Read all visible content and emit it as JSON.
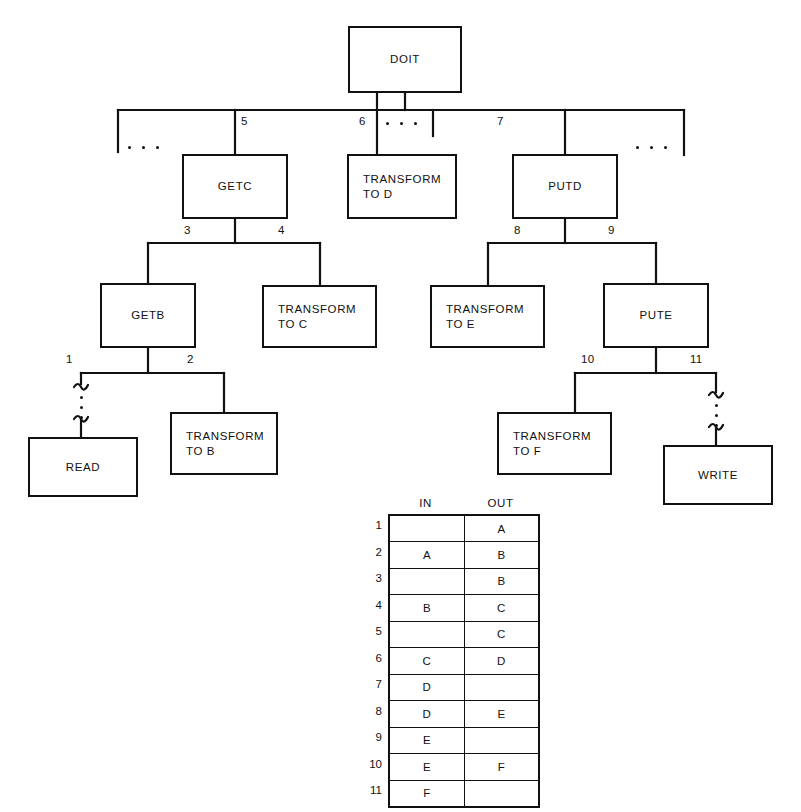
{
  "diagram": {
    "nodes": [
      {
        "id": "doit",
        "label": "DOIT",
        "x": 348,
        "y": 26,
        "w": 114,
        "h": 67,
        "align": "center"
      },
      {
        "id": "getc",
        "label": "GETC",
        "x": 182,
        "y": 154,
        "w": 106,
        "h": 65,
        "align": "center"
      },
      {
        "id": "transform_d",
        "label": "TRANSFORM\nTO D",
        "x": 347,
        "y": 154,
        "w": 110,
        "h": 65,
        "align": "left"
      },
      {
        "id": "putd",
        "label": "PUTD",
        "x": 512,
        "y": 154,
        "w": 106,
        "h": 65,
        "align": "center"
      },
      {
        "id": "getb",
        "label": "GETB",
        "x": 100,
        "y": 283,
        "w": 96,
        "h": 65,
        "align": "center"
      },
      {
        "id": "transform_c",
        "label": "TRANSFORM\nTO C",
        "x": 262,
        "y": 285,
        "w": 115,
        "h": 63,
        "align": "left"
      },
      {
        "id": "transform_e",
        "label": "TRANSFORM\nTO E",
        "x": 430,
        "y": 285,
        "w": 115,
        "h": 63,
        "align": "left"
      },
      {
        "id": "pute",
        "label": "PUTE",
        "x": 603,
        "y": 283,
        "w": 106,
        "h": 65,
        "align": "center"
      },
      {
        "id": "read",
        "label": "READ",
        "x": 28,
        "y": 437,
        "w": 110,
        "h": 60,
        "align": "center"
      },
      {
        "id": "transform_b",
        "label": "TRANSFORM\nTO B",
        "x": 170,
        "y": 412,
        "w": 108,
        "h": 63,
        "align": "left"
      },
      {
        "id": "transform_f",
        "label": "TRANSFORM\nTO F",
        "x": 497,
        "y": 412,
        "w": 115,
        "h": 63,
        "align": "left"
      },
      {
        "id": "write",
        "label": "WRITE",
        "x": 663,
        "y": 445,
        "w": 110,
        "h": 60,
        "align": "center"
      }
    ],
    "edge_numbers": [
      {
        "id": "n5",
        "label": "5",
        "x": 241,
        "y": 115
      },
      {
        "id": "n6",
        "label": "6",
        "x": 359,
        "y": 115
      },
      {
        "id": "n7",
        "label": "7",
        "x": 497,
        "y": 115
      },
      {
        "id": "n3",
        "label": "3",
        "x": 184,
        "y": 224
      },
      {
        "id": "n4",
        "label": "4",
        "x": 278,
        "y": 224
      },
      {
        "id": "n8",
        "label": "8",
        "x": 514,
        "y": 224
      },
      {
        "id": "n9",
        "label": "9",
        "x": 608,
        "y": 224
      },
      {
        "id": "n1",
        "label": "1",
        "x": 66,
        "y": 353
      },
      {
        "id": "n2",
        "label": "2",
        "x": 187,
        "y": 353
      },
      {
        "id": "n10",
        "label": "10",
        "x": 581,
        "y": 353
      },
      {
        "id": "n11",
        "label": "11",
        "x": 690,
        "y": 353
      }
    ],
    "ellipses": [
      {
        "id": "left-branch-ellipsis",
        "orient": "h",
        "x": 128,
        "y": 146
      },
      {
        "id": "center-branch-ellipsis",
        "orient": "h",
        "x": 382,
        "y": 121
      },
      {
        "id": "right-branch-ellipsis",
        "orient": "h",
        "x": 638,
        "y": 146
      },
      {
        "id": "read-link-ellipsis",
        "orient": "v",
        "x": 81,
        "y": 402
      },
      {
        "id": "write-link-ellipsis",
        "orient": "v",
        "x": 716,
        "y": 410
      }
    ]
  },
  "table": {
    "columns": [
      "IN",
      "OUT"
    ],
    "row_labels": [
      "1",
      "2",
      "3",
      "4",
      "5",
      "6",
      "7",
      "8",
      "9",
      "10",
      "11"
    ],
    "rows": [
      {
        "num": "1",
        "in": "",
        "out": "A"
      },
      {
        "num": "2",
        "in": "A",
        "out": "B"
      },
      {
        "num": "3",
        "in": "",
        "out": "B"
      },
      {
        "num": "4",
        "in": "B",
        "out": "C"
      },
      {
        "num": "5",
        "in": "",
        "out": "C"
      },
      {
        "num": "6",
        "in": "C",
        "out": "D"
      },
      {
        "num": "7",
        "in": "D",
        "out": ""
      },
      {
        "num": "8",
        "in": "D",
        "out": "E"
      },
      {
        "num": "9",
        "in": "E",
        "out": ""
      },
      {
        "num": "10",
        "in": "E",
        "out": "F"
      },
      {
        "num": "11",
        "in": "F",
        "out": ""
      }
    ]
  },
  "colors": {
    "ink": "#111111",
    "paper": "#ffffff"
  }
}
